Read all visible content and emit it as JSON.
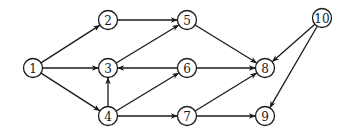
{
  "diagram": {
    "type": "directed-graph",
    "node_radius": 9.5,
    "nodes": [
      {
        "id": "1",
        "label": "1",
        "x": 33,
        "y": 68
      },
      {
        "id": "2",
        "label": "2",
        "x": 108,
        "y": 20
      },
      {
        "id": "3",
        "label": "3",
        "x": 108,
        "y": 68
      },
      {
        "id": "4",
        "label": "4",
        "x": 108,
        "y": 116
      },
      {
        "id": "5",
        "label": "5",
        "x": 187,
        "y": 20
      },
      {
        "id": "6",
        "label": "6",
        "x": 187,
        "y": 68
      },
      {
        "id": "7",
        "label": "7",
        "x": 187,
        "y": 116
      },
      {
        "id": "8",
        "label": "8",
        "x": 265,
        "y": 68
      },
      {
        "id": "9",
        "label": "9",
        "x": 265,
        "y": 116
      },
      {
        "id": "10",
        "label": "10",
        "x": 322,
        "y": 18
      }
    ],
    "edges": [
      {
        "from": "1",
        "to": "2"
      },
      {
        "from": "1",
        "to": "3"
      },
      {
        "from": "1",
        "to": "4"
      },
      {
        "from": "2",
        "to": "5"
      },
      {
        "from": "3",
        "to": "5"
      },
      {
        "from": "6",
        "to": "3"
      },
      {
        "from": "4",
        "to": "3"
      },
      {
        "from": "4",
        "to": "6"
      },
      {
        "from": "4",
        "to": "7"
      },
      {
        "from": "5",
        "to": "8"
      },
      {
        "from": "6",
        "to": "8"
      },
      {
        "from": "7",
        "to": "8"
      },
      {
        "from": "7",
        "to": "9"
      },
      {
        "from": "10",
        "to": "8"
      },
      {
        "from": "10",
        "to": "9"
      }
    ]
  }
}
